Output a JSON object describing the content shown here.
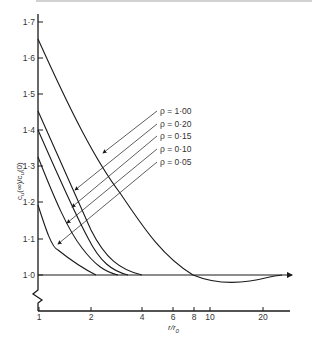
{
  "chart_data": {
    "type": "line",
    "title": "",
    "xlabel": "r/r0",
    "ylabel": "cu(∞)/cu(0)",
    "x_scale": "log",
    "xlim": [
      1,
      25
    ],
    "ylim": [
      1.0,
      1.7
    ],
    "x_ticks": [
      "1",
      "2",
      "4",
      "6",
      "8",
      "10",
      "20"
    ],
    "y_ticks": [
      "1·0",
      "1·1",
      "1·2",
      "1·3",
      "1·4",
      "1·5",
      "1·6",
      "1·7"
    ],
    "grid": false,
    "legend_position": "center-right, with leader arrows to curves",
    "series": [
      {
        "name": "ρ = 1·00",
        "x": [
          1,
          1.5,
          2,
          3,
          4,
          6,
          8,
          10,
          12,
          15,
          20,
          22
        ],
        "y": [
          1.65,
          1.47,
          1.36,
          1.21,
          1.13,
          1.03,
          1.0,
          0.985,
          0.985,
          0.99,
          0.998,
          1.0
        ]
      },
      {
        "name": "ρ = 0·20",
        "x": [
          1,
          1.5,
          2,
          3,
          4,
          5
        ],
        "y": [
          1.455,
          1.26,
          1.13,
          1.04,
          1.005,
          1.0
        ]
      },
      {
        "name": "ρ = 0·15",
        "x": [
          1,
          1.5,
          2,
          3,
          4
        ],
        "y": [
          1.4,
          1.22,
          1.1,
          1.02,
          1.0
        ]
      },
      {
        "name": "ρ = 0·10",
        "x": [
          1,
          1.5,
          2,
          3,
          3.5
        ],
        "y": [
          1.325,
          1.15,
          1.07,
          1.01,
          1.0
        ]
      },
      {
        "name": "ρ = 0·05",
        "x": [
          1,
          1.3,
          1.6,
          2,
          2.2
        ],
        "y": [
          1.19,
          1.08,
          1.05,
          1.01,
          1.0
        ]
      }
    ]
  },
  "legend": {
    "items": [
      {
        "label": "ρ = 1·00"
      },
      {
        "label": "ρ = 0·20"
      },
      {
        "label": "ρ = 0·15"
      },
      {
        "label": "ρ = 0·10"
      },
      {
        "label": "ρ = 0·05"
      }
    ]
  },
  "axes": {
    "x_label_main": "r/r",
    "x_label_sub": "0",
    "y_label": "c",
    "y_label_sub": "u",
    "y_label_rest": "(∞)/c",
    "y_label_sub2": "u",
    "y_label_end": "(0)",
    "x_ticks": [
      {
        "label": "1",
        "x": 39
      },
      {
        "label": "2",
        "x": 91
      },
      {
        "label": "4",
        "x": 142
      },
      {
        "label": "6",
        "x": 173
      },
      {
        "label": "8",
        "x": 194
      },
      {
        "label": "10",
        "x": 210
      },
      {
        "label": "20",
        "x": 263
      }
    ],
    "y_ticks": [
      {
        "label": "1·7",
        "y": 22
      },
      {
        "label": "1·6",
        "y": 58
      },
      {
        "label": "1·5",
        "y": 94
      },
      {
        "label": "1·4",
        "y": 130
      },
      {
        "label": "1·3",
        "y": 166
      },
      {
        "label": "1·2",
        "y": 202
      },
      {
        "label": "1·1",
        "y": 239
      },
      {
        "label": "1·0",
        "y": 275
      }
    ]
  }
}
